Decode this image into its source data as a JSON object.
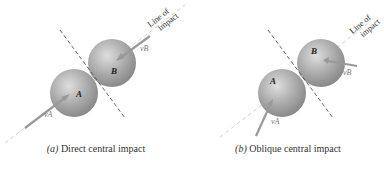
{
  "figure": {
    "panels": [
      {
        "id": "a",
        "caption_letter": "(a)",
        "caption_text": "Direct central impact",
        "sphere_a_label": "A",
        "sphere_b_label": "B",
        "velocity_a_label": "vA",
        "velocity_b_label": "vB",
        "line_of_impact_line1": "Line of",
        "line_of_impact_line2": "impact"
      },
      {
        "id": "b",
        "caption_letter": "(b)",
        "caption_text": "Oblique central impact",
        "sphere_a_label": "A",
        "sphere_b_label": "B",
        "velocity_a_label": "vA",
        "velocity_b_label": "vB",
        "line_of_impact_line1": "Line of",
        "line_of_impact_line2": "impact"
      }
    ],
    "colors": {
      "sphere": "#a6a6a6",
      "sphere_highlight": "#d9d9d9",
      "arrow": "#9a9a9a",
      "dashed_line": "#555555",
      "line_of_impact": "#bbbbbb"
    }
  }
}
